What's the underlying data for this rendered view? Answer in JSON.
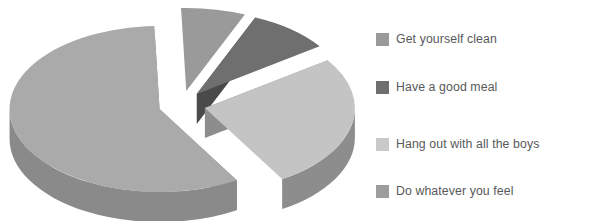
{
  "chart_data": {
    "type": "pie",
    "title": "",
    "subtitle": "",
    "xlabel": "",
    "ylabel": "",
    "grid": false,
    "three_d": true,
    "exploded": true,
    "legend_position": "right",
    "categories": [
      "Get yourself clean",
      "Have a good meal",
      "Hang out with all the boys",
      "Do whatever you feel"
    ],
    "values": [
      7,
      9,
      26,
      58
    ],
    "units": "percent",
    "slices": [
      {
        "label": "Get yourself clean",
        "value": 7,
        "color": "#9a9a9a",
        "side_color": "#7d7d7d",
        "start_angle": 268,
        "end_angle": 293
      },
      {
        "label": "Have a good meal",
        "value": 9,
        "color": "#6f6f6f",
        "side_color": "#4a4a4a",
        "start_angle": 293,
        "end_angle": 325
      },
      {
        "label": "Hang out with all the boys",
        "value": 26,
        "color": "#c4c4c4",
        "side_color": "#8d8d8d",
        "start_angle": 325,
        "end_angle": 419
      },
      {
        "label": "Do whatever you feel",
        "value": 58,
        "color": "#aaaaaa",
        "side_color": "#8a8a8a",
        "start_angle": 59,
        "end_angle": 268
      }
    ]
  },
  "legend": {
    "items": [
      {
        "label": "Get yourself clean",
        "color": "#9a9a9a",
        "y": 33
      },
      {
        "label": "Have a good meal",
        "color": "#6f6f6f",
        "y": 81
      },
      {
        "label": "Hang out with all the boys",
        "color": "#c9c9c9",
        "y": 138
      },
      {
        "label": "Do whatever you feel",
        "color": "#9d9d9d",
        "y": 185
      }
    ]
  },
  "colors": {
    "background": "#ffffff",
    "legend_text": "#58595b",
    "slice_1": "#9a9a9a",
    "slice_2": "#6f6f6f",
    "slice_3": "#c4c4c4",
    "slice_4": "#aaaaaa"
  }
}
